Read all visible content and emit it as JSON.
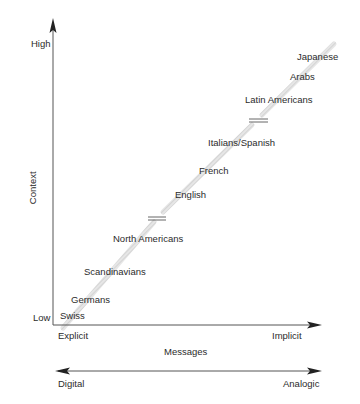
{
  "diagram": {
    "y_axis": {
      "label": "Context",
      "high_label": "High",
      "low_label": "Low"
    },
    "x_axis": {
      "label": "Messages",
      "start_label": "Explicit",
      "end_label": "Implicit"
    },
    "bottom_scale": {
      "start_label": "Digital",
      "end_label": "Analogic"
    },
    "cultures": [
      {
        "name": "Swiss"
      },
      {
        "name": "Germans"
      },
      {
        "name": "Scandinavians"
      },
      {
        "name": "North Americans"
      },
      {
        "name": "English"
      },
      {
        "name": "French"
      },
      {
        "name": "Italians/Spanish"
      },
      {
        "name": "Latin Americans"
      },
      {
        "name": "Arabs"
      },
      {
        "name": "Japanese"
      }
    ],
    "colors": {
      "axis": "#3a3a3a",
      "band": "#d4d4d4",
      "text": "#2b2b2b"
    }
  }
}
